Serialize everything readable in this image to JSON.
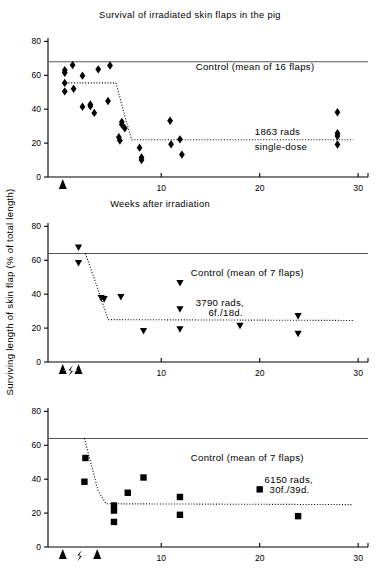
{
  "figure": {
    "title": "Survival of irradiated skin flaps in the pig",
    "ylabel": "Surviving length of skin flap (% of total length)",
    "xlabel": "Weeks after irradiation"
  },
  "chart_data": [
    {
      "type": "scatter",
      "panel": 1,
      "title": "Survival of irradiated skin flaps in the pig",
      "xlabel": "Weeks after irradiation",
      "ylabel": "Surviving length of skin flap (% of total length)",
      "xlim": [
        -1.5,
        31
      ],
      "ylim": [
        0,
        82
      ],
      "xticks": [
        10,
        20,
        30
      ],
      "xticklabels": [
        "10",
        "20",
        "30"
      ],
      "yticks": [
        0,
        20,
        40,
        60,
        80
      ],
      "yticklabels": [
        "0",
        "20",
        "40",
        "60",
        "80"
      ],
      "grid": false,
      "legend": "none",
      "marker": "diamond",
      "annotations": [
        {
          "text": "Control (mean of 16 flaps)",
          "x": 13.5,
          "y": 63
        },
        {
          "text": "1863 rads",
          "x": 19.5,
          "y": 25
        },
        {
          "text": "single-dose",
          "x": 19.5,
          "y": 16
        }
      ],
      "control_line": {
        "y": 68,
        "label": "Control (mean of 16 flaps)",
        "n_flaps": 16
      },
      "fit_line": {
        "style": "dotted",
        "points": [
          [
            0.0,
            55.5
          ],
          [
            5.4,
            55.5
          ],
          [
            6.3,
            36.0
          ],
          [
            7.0,
            22.0
          ],
          [
            29.5,
            22.0
          ]
        ]
      },
      "irradiation_arrows": [
        0.0
      ],
      "points": [
        {
          "x": 0.2,
          "y": 63.0
        },
        {
          "x": 0.2,
          "y": 61.5
        },
        {
          "x": 0.2,
          "y": 55.5
        },
        {
          "x": 0.2,
          "y": 50.5
        },
        {
          "x": 1.0,
          "y": 66.0
        },
        {
          "x": 1.1,
          "y": 52.0
        },
        {
          "x": 2.0,
          "y": 59.8
        },
        {
          "x": 2.0,
          "y": 41.5
        },
        {
          "x": 2.8,
          "y": 42.8
        },
        {
          "x": 2.8,
          "y": 41.8
        },
        {
          "x": 3.2,
          "y": 37.8
        },
        {
          "x": 3.6,
          "y": 63.5
        },
        {
          "x": 4.8,
          "y": 65.8
        },
        {
          "x": 4.6,
          "y": 44.8
        },
        {
          "x": 6.0,
          "y": 32.5
        },
        {
          "x": 6.0,
          "y": 31.0
        },
        {
          "x": 6.3,
          "y": 28.8
        },
        {
          "x": 5.7,
          "y": 23.5
        },
        {
          "x": 5.8,
          "y": 21.5
        },
        {
          "x": 7.8,
          "y": 17.3
        },
        {
          "x": 8.0,
          "y": 11.5
        },
        {
          "x": 8.0,
          "y": 10.0
        },
        {
          "x": 10.9,
          "y": 33.2
        },
        {
          "x": 11.0,
          "y": 19.3
        },
        {
          "x": 11.9,
          "y": 22.2
        },
        {
          "x": 12.1,
          "y": 13.2
        },
        {
          "x": 27.9,
          "y": 38.2
        },
        {
          "x": 27.9,
          "y": 25.8
        },
        {
          "x": 27.9,
          "y": 24.2
        },
        {
          "x": 27.9,
          "y": 19.2
        }
      ]
    },
    {
      "type": "scatter",
      "panel": 2,
      "xlabel": "",
      "ylabel": "Surviving length of skin flap (% of total length)",
      "xlim": [
        -1.5,
        31
      ],
      "ylim": [
        0,
        82
      ],
      "xticks": [
        10,
        20,
        30
      ],
      "xticklabels": [
        "10",
        "20",
        "30"
      ],
      "yticks": [
        0,
        20,
        40,
        60,
        80
      ],
      "yticklabels": [
        "0",
        "20",
        "40",
        "60",
        "80"
      ],
      "grid": false,
      "legend": "none",
      "marker": "triangle-down",
      "annotations": [
        {
          "text": "Control (mean of 7 flaps)",
          "x": 13.0,
          "y": 51
        },
        {
          "text": "3790 rads,",
          "x": 13.5,
          "y": 33
        },
        {
          "text": "6f./18d.",
          "x": 14.8,
          "y": 27
        }
      ],
      "control_line": {
        "y": 64,
        "label": "Control (mean of 7 flaps)",
        "n_flaps": 7
      },
      "fit_line": {
        "style": "dotted",
        "points": [
          [
            2.3,
            64.0
          ],
          [
            3.9,
            37.5
          ],
          [
            4.6,
            25.0
          ],
          [
            29.5,
            24.5
          ]
        ]
      },
      "irradiation_arrows": [
        0.0,
        1.6
      ],
      "break_symbol_x": 0.8,
      "points": [
        {
          "x": 1.6,
          "y": 67.5
        },
        {
          "x": 1.6,
          "y": 58.3
        },
        {
          "x": 3.9,
          "y": 37.6
        },
        {
          "x": 4.2,
          "y": 37.0
        },
        {
          "x": 5.9,
          "y": 38.3
        },
        {
          "x": 8.2,
          "y": 18.2
        },
        {
          "x": 11.9,
          "y": 46.5
        },
        {
          "x": 11.9,
          "y": 31.0
        },
        {
          "x": 11.9,
          "y": 19.2
        },
        {
          "x": 18.0,
          "y": 21.3
        },
        {
          "x": 23.9,
          "y": 27.0
        },
        {
          "x": 23.9,
          "y": 16.6
        }
      ]
    },
    {
      "type": "scatter",
      "panel": 3,
      "xlabel": "",
      "ylabel": "Surviving length of skin flap (% of total length)",
      "xlim": [
        -1.5,
        31
      ],
      "ylim": [
        0,
        82
      ],
      "xticks": [
        10,
        20,
        30
      ],
      "xticklabels": [
        "10",
        "20",
        "30"
      ],
      "yticks": [
        0,
        20,
        40,
        60,
        80
      ],
      "yticklabels": [
        "0",
        "20",
        "40",
        "60",
        "80"
      ],
      "grid": false,
      "legend": "none",
      "marker": "square",
      "annotations": [
        {
          "text": "Control (mean of 7 flaps)",
          "x": 13.0,
          "y": 51
        },
        {
          "text": "6150 rads,",
          "x": 20.5,
          "y": 38
        },
        {
          "text": "30f./39d.",
          "x": 21.0,
          "y": 32
        }
      ],
      "control_line": {
        "y": 64,
        "label": "Control (mean of 7 flaps)",
        "n_flaps": 7
      },
      "fit_line": {
        "style": "dotted",
        "points": [
          [
            2.2,
            64.0
          ],
          [
            3.6,
            33.0
          ],
          [
            4.4,
            25.5
          ],
          [
            29.5,
            25.0
          ]
        ]
      },
      "irradiation_arrows": [
        0.0,
        3.5
      ],
      "break_symbol_x": 1.7,
      "points": [
        {
          "x": 2.3,
          "y": 52.5
        },
        {
          "x": 2.2,
          "y": 38.5
        },
        {
          "x": 5.2,
          "y": 24.5
        },
        {
          "x": 5.2,
          "y": 21.5
        },
        {
          "x": 5.2,
          "y": 14.8
        },
        {
          "x": 6.6,
          "y": 32.0
        },
        {
          "x": 8.2,
          "y": 41.0
        },
        {
          "x": 11.9,
          "y": 29.5
        },
        {
          "x": 11.9,
          "y": 19.0
        },
        {
          "x": 20.0,
          "y": 34.0
        },
        {
          "x": 23.9,
          "y": 18.2
        }
      ]
    }
  ]
}
